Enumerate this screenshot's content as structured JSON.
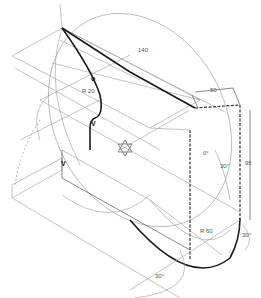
{
  "drawing": {
    "type": "isometric technical drawing",
    "dimensions": {
      "length_top": "140",
      "offset_top": "50",
      "height_right": "95",
      "radius_inner": "R 20",
      "radius_outer": "R 60",
      "angle_1": "30°",
      "angle_2": "30°",
      "angle_3": "30°",
      "angle_zero": "0°"
    },
    "markers": {
      "point_o": "o",
      "point_v1": "V",
      "point_v2": "V"
    }
  }
}
